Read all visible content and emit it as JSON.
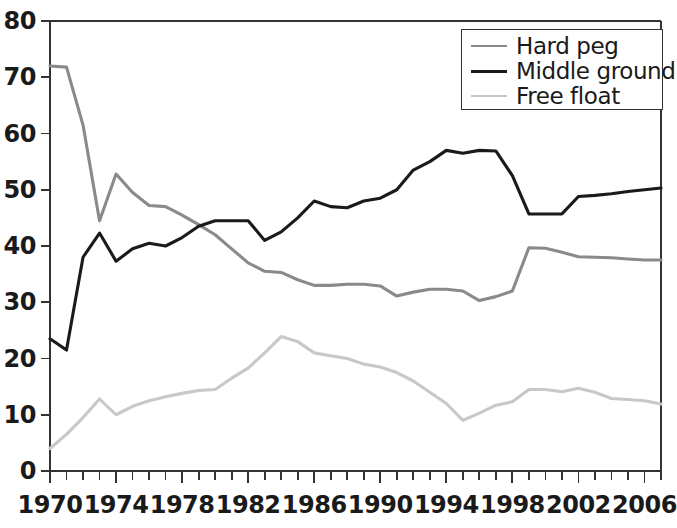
{
  "chart_data": {
    "type": "line",
    "title": "",
    "xlabel": "",
    "ylabel": "",
    "xlim": [
      1970,
      2007
    ],
    "ylim": [
      0,
      80
    ],
    "grid": false,
    "legend_position": "top-right",
    "y_ticks": [
      0,
      10,
      20,
      30,
      40,
      50,
      60,
      70,
      80
    ],
    "y_tick_labels": [
      "0",
      "10",
      "20",
      "30",
      "40",
      "50",
      "60",
      "70",
      "80"
    ],
    "x_ticks": [
      1970,
      1974,
      1978,
      1982,
      1986,
      1990,
      1994,
      1998,
      2002,
      2006
    ],
    "x_tick_labels": [
      "1970",
      "1974",
      "1978",
      "1982",
      "1986",
      "1990",
      "1994",
      "1998",
      "2002",
      "2006"
    ],
    "x_minor_tick_interval": 1,
    "x": [
      1970,
      1971,
      1972,
      1973,
      1974,
      1975,
      1976,
      1977,
      1978,
      1979,
      1980,
      1981,
      1982,
      1983,
      1984,
      1985,
      1986,
      1987,
      1988,
      1989,
      1990,
      1991,
      1992,
      1993,
      1994,
      1995,
      1996,
      1997,
      1998,
      1999,
      2000,
      2001,
      2002,
      2003,
      2004,
      2005,
      2006,
      2007
    ],
    "series": [
      {
        "name": "Hard peg",
        "color": "#8a8a8a",
        "values": [
          72.0,
          71.8,
          61.5,
          44.5,
          52.8,
          49.5,
          47.2,
          47.0,
          45.5,
          43.8,
          42.0,
          39.5,
          37.0,
          35.5,
          35.3,
          34.0,
          33.0,
          33.0,
          33.2,
          33.2,
          32.9,
          31.1,
          31.8,
          32.3,
          32.3,
          32.0,
          30.3,
          31.0,
          32.0,
          39.7,
          39.6,
          38.9,
          38.1,
          38.0,
          37.9,
          37.7,
          37.5,
          37.5
        ]
      },
      {
        "name": "Middle ground",
        "color": "#1a1a1a",
        "values": [
          23.5,
          21.5,
          38.0,
          42.3,
          37.3,
          39.5,
          40.5,
          40.0,
          41.5,
          43.5,
          44.5,
          44.5,
          44.5,
          41.0,
          42.5,
          45.0,
          48.0,
          47.0,
          46.8,
          48.0,
          48.5,
          50.0,
          53.5,
          55.0,
          57.0,
          56.5,
          57.0,
          56.9,
          52.5,
          45.7,
          45.7,
          45.7,
          48.8,
          49.0,
          49.3,
          49.7,
          50.0,
          50.3
        ]
      },
      {
        "name": "Free float",
        "color": "#c8c8c8",
        "values": [
          4.0,
          6.5,
          9.5,
          12.8,
          10.0,
          11.5,
          12.5,
          13.2,
          13.8,
          14.3,
          14.5,
          16.5,
          18.3,
          21.0,
          23.9,
          23.0,
          21.0,
          20.5,
          20.0,
          19.0,
          18.5,
          17.5,
          16.0,
          14.0,
          12.0,
          9.0,
          10.3,
          11.7,
          12.3,
          14.5,
          14.5,
          14.1,
          14.7,
          14.0,
          12.9,
          12.7,
          12.5,
          11.9
        ]
      }
    ]
  },
  "legend": {
    "items": [
      {
        "label": "Hard peg"
      },
      {
        "label": "Middle ground"
      },
      {
        "label": "Free float"
      }
    ]
  },
  "axis_colors": {
    "axis_line": "#333333"
  }
}
